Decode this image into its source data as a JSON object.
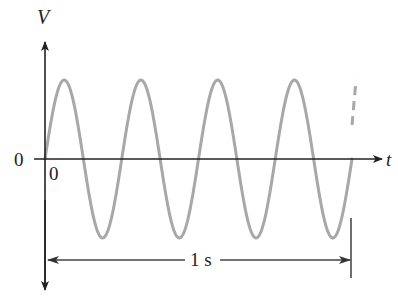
{
  "diagram": {
    "y_axis_label": "V",
    "x_axis_label": "t",
    "y_origin_label": "0",
    "x_origin_label": "0",
    "interval_label": "1 s",
    "cycles_shown": 4,
    "colors": {
      "wave": "#a8a8a8",
      "axes": "#222222",
      "text": "#222222"
    }
  }
}
